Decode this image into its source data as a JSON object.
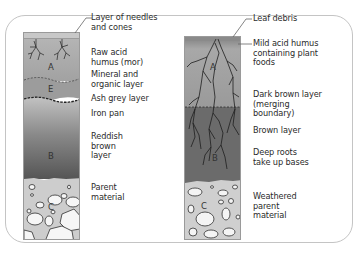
{
  "diagram": {
    "type": "soil profiles comparison",
    "left_profile": {
      "horizons": [
        "A",
        "E",
        "B",
        "C"
      ],
      "labels": [
        "Layer of needles\nand cones",
        "Raw acid\nhumus (mor)",
        "Mineral and\norganic layer",
        "Ash grey layer",
        "Iron pan",
        "Reddish\nbrown\nlayer",
        "Parent\nmaterial"
      ]
    },
    "right_profile": {
      "horizons": [
        "A",
        "B",
        "C"
      ],
      "labels": [
        "Leaf debris",
        "Mild acid humus\ncontaining plant\nfoods",
        "Dark brown layer\n(merging\nboundary)",
        "Brown layer",
        "Deep roots\ntake up bases",
        "Weathered\nparent\nmaterial"
      ]
    },
    "colors": {
      "frame": "#c4c4c4",
      "litter": "#b8b8b8",
      "a_horizon": "#a6a6a6",
      "e_horizon": "#999999",
      "b_horizon_dark": "#5e5e5e",
      "c_horizon": "#cfcfcf",
      "stone": "#f4f4f4",
      "text": "#2b2b2b"
    }
  }
}
